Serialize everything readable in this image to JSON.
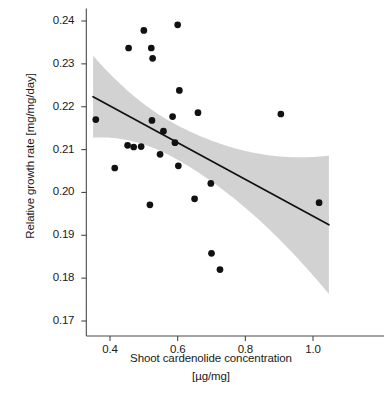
{
  "chart_data": {
    "type": "scatter",
    "title": "",
    "xlabel": "Shoot cardenolide concentration [µg/mg]",
    "xlabel_line1": "Shoot cardenolide concentration",
    "xlabel_line2": "[µg/mg]",
    "ylabel": "Relative growth rate  [mg/mg/day]",
    "xlim": [
      0.33,
      1.07
    ],
    "ylim": [
      0.1665,
      0.2415
    ],
    "xticks": [
      0.4,
      0.6,
      0.8,
      1.0
    ],
    "xtick_labels": [
      "0.4",
      "0.6",
      "0.8",
      "1.0"
    ],
    "yticks": [
      0.17,
      0.18,
      0.19,
      0.2,
      0.21,
      0.22,
      0.23,
      0.24
    ],
    "ytick_labels": [
      "0.17",
      "0.18",
      "0.19",
      "0.20",
      "0.21",
      "0.22",
      "0.23",
      "0.24"
    ],
    "grid": false,
    "legend": null,
    "marker_color": "#111111",
    "marker_size": 5.2,
    "line_color": "#111111",
    "band_color": "#d2d2d2",
    "axis_color": "#4a4a4a",
    "points": [
      {
        "x": 0.358,
        "y": 0.217
      },
      {
        "x": 0.414,
        "y": 0.2057
      },
      {
        "x": 0.452,
        "y": 0.211
      },
      {
        "x": 0.455,
        "y": 0.2337
      },
      {
        "x": 0.47,
        "y": 0.2106
      },
      {
        "x": 0.492,
        "y": 0.2107
      },
      {
        "x": 0.5,
        "y": 0.2378
      },
      {
        "x": 0.518,
        "y": 0.1971
      },
      {
        "x": 0.522,
        "y": 0.2337
      },
      {
        "x": 0.524,
        "y": 0.2168
      },
      {
        "x": 0.526,
        "y": 0.2313
      },
      {
        "x": 0.548,
        "y": 0.2089
      },
      {
        "x": 0.558,
        "y": 0.2143
      },
      {
        "x": 0.585,
        "y": 0.2177
      },
      {
        "x": 0.592,
        "y": 0.2116
      },
      {
        "x": 0.6,
        "y": 0.2391
      },
      {
        "x": 0.602,
        "y": 0.2062
      },
      {
        "x": 0.605,
        "y": 0.2238
      },
      {
        "x": 0.65,
        "y": 0.1985
      },
      {
        "x": 0.66,
        "y": 0.2186
      },
      {
        "x": 0.698,
        "y": 0.2021
      },
      {
        "x": 0.7,
        "y": 0.1858
      },
      {
        "x": 0.725,
        "y": 0.182
      },
      {
        "x": 0.905,
        "y": 0.2183
      },
      {
        "x": 1.018,
        "y": 0.1976
      }
    ],
    "fit_line": {
      "x_start": 0.35,
      "y_start": 0.22235,
      "x_end": 1.047,
      "y_end": 0.19245
    },
    "confidence_band": {
      "x_start": 0.35,
      "upper_start": 0.23105,
      "lower_start": 0.21195,
      "x_end": 1.047,
      "upper_end": 0.2079,
      "lower_end": 0.1756
    }
  }
}
